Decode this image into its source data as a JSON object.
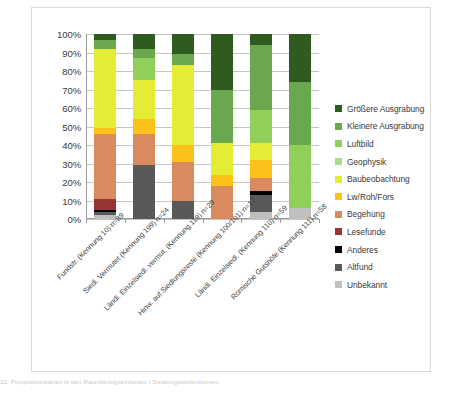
{
  "caption": "22: Prospektionsarten in den Raumbezugseinheiten / Siedlungsstellenformen",
  "chart_data": {
    "type": "bar",
    "stacked": true,
    "normalized": true,
    "title": "",
    "xlabel": "",
    "ylabel": "",
    "ylim": [
      0,
      100
    ],
    "grid": true,
    "legend_position": "right",
    "ytick_labels": [
      "0%",
      "10%",
      "20%",
      "30%",
      "40%",
      "50%",
      "60%",
      "70%",
      "80%",
      "90%",
      "100%"
    ],
    "ytick_values": [
      0,
      10,
      20,
      30,
      40,
      50,
      60,
      70,
      80,
      90,
      100
    ],
    "categories": [
      "Fundstr. (Kennung 10) n=89",
      "Siedl. Vermutet (Kennung 199) n=24",
      "Ländl. Einzelsiedl. vermut. (Kennung 119) n=29",
      "Hinw. auf Siedlungsreste (Kennung 100/101) n=17",
      "Ländl. Einzelsiedl. (Kennung 110) n=59",
      "Römische Gutshöfe (Kennung 111) n=58"
    ],
    "series": [
      {
        "name": "Unbekannt",
        "color": "#bfbfbf",
        "values": [
          2,
          0,
          0,
          0,
          4,
          6
        ]
      },
      {
        "name": "Altfund",
        "color": "#595959",
        "values": [
          2,
          29,
          10,
          0,
          9,
          0
        ]
      },
      {
        "name": "Anderes",
        "color": "#000000",
        "values": [
          1,
          0,
          0,
          0,
          2,
          0
        ]
      },
      {
        "name": "Lesefunde",
        "color": "#963634",
        "values": [
          6,
          0,
          0,
          0,
          0,
          0
        ]
      },
      {
        "name": "Begehung",
        "color": "#d98b5f",
        "values": [
          35,
          17,
          21,
          18,
          7,
          0
        ]
      },
      {
        "name": "Lw/Roh/Fors",
        "color": "#fcc219",
        "values": [
          3,
          8,
          9,
          6,
          10,
          0
        ]
      },
      {
        "name": "Baubeobachtung",
        "color": "#e5ec36",
        "values": [
          43,
          21,
          43,
          17,
          9,
          0
        ]
      },
      {
        "name": "Geophysik",
        "color": "#a9dd8c",
        "values": [
          0,
          0,
          0,
          0,
          0,
          0
        ]
      },
      {
        "name": "Luftbild",
        "color": "#8fcf5a",
        "values": [
          0,
          12,
          0,
          0,
          18,
          34
        ]
      },
      {
        "name": "Kleinere Ausgrabung",
        "color": "#6aa84f",
        "values": [
          5,
          5,
          6,
          29,
          35,
          34
        ]
      },
      {
        "name": "Größere Ausgrabung",
        "color": "#2f5b1f",
        "values": [
          3,
          8,
          11,
          30,
          6,
          26
        ]
      }
    ],
    "legend_order": [
      "Größere Ausgrabung",
      "Kleinere Ausgrabung",
      "Luftbild",
      "Geophysik",
      "Baubeobachtung",
      "Lw/Roh/Fors",
      "Begehung",
      "Lesefunde",
      "Anderes",
      "Altfund",
      "Unbekannt"
    ]
  }
}
